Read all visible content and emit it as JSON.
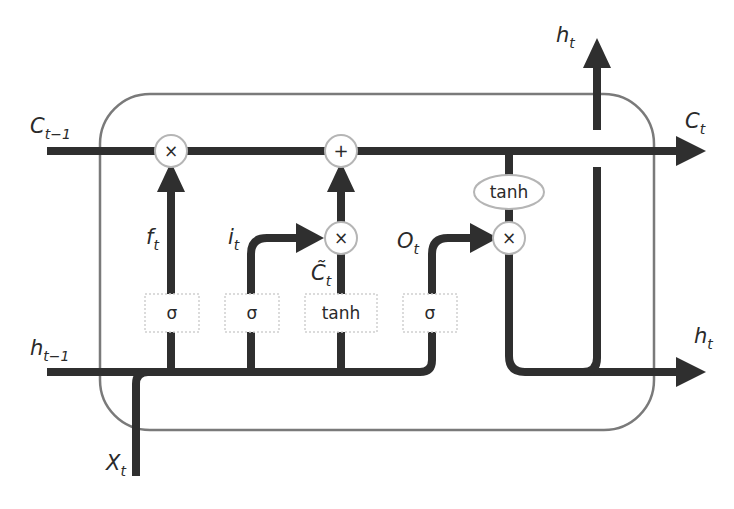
{
  "diagram": {
    "colors": {
      "line": "#2f2f2f",
      "cell_border": "#7a7a7a",
      "node_border": "#b5b5b5",
      "gate_border": "#cfcfcf",
      "background": "#ffffff"
    },
    "inputs": {
      "cell_prev": {
        "base": "C",
        "sub": "t−1"
      },
      "hidden_prev": {
        "base": "h",
        "sub": "t−1"
      },
      "input": {
        "base": "X",
        "sub": "t"
      }
    },
    "outputs": {
      "cell_out": {
        "base": "C",
        "sub": "t"
      },
      "hidden_up": {
        "base": "h",
        "sub": "t"
      },
      "hidden_right": {
        "base": "h",
        "sub": "t"
      }
    },
    "gate_labels": {
      "forget": {
        "base": "f",
        "sub": "t"
      },
      "input": {
        "base": "i",
        "sub": "t"
      },
      "candidate": {
        "base": "C̃",
        "sub": "t"
      },
      "output": {
        "base": "O",
        "sub": "t"
      }
    },
    "gates": [
      {
        "id": "forget-gate",
        "label": "σ"
      },
      {
        "id": "input-gate",
        "label": "σ"
      },
      {
        "id": "candidate-gate",
        "label": "tanh"
      },
      {
        "id": "output-gate",
        "label": "σ"
      }
    ],
    "operations": {
      "forget_multiply": "×",
      "cell_add": "+",
      "input_multiply": "×",
      "output_multiply": "×",
      "cell_tanh": "tanh"
    }
  }
}
